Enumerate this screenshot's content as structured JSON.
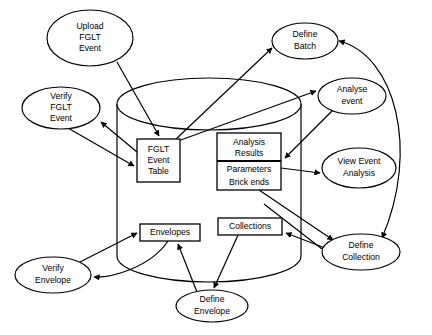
{
  "diagram": {
    "type": "data-flow-diagram",
    "background_color": "#ffffff",
    "line_color": "#000000",
    "datastore": {
      "name": "database-cylinder",
      "label": ""
    },
    "processes": [
      {
        "id": "upload-fglt-event",
        "lines": [
          "Upload",
          "FGLT",
          "Event"
        ],
        "cx": 90,
        "cy": 38,
        "rx": 43,
        "ry": 28
      },
      {
        "id": "verify-fglt-event",
        "lines": [
          "Verify",
          "FGLT",
          "Event"
        ],
        "cx": 61,
        "cy": 108,
        "rx": 39,
        "ry": 21
      },
      {
        "id": "define-batch",
        "lines": [
          "Define",
          "Batch"
        ],
        "cx": 305,
        "cy": 41,
        "rx": 33,
        "ry": 18
      },
      {
        "id": "analyse-event",
        "lines": [
          "Analyse",
          "event"
        ],
        "cx": 352,
        "cy": 96,
        "rx": 34,
        "ry": 18
      },
      {
        "id": "view-event-analysis",
        "lines": [
          "View Event",
          "Analysis"
        ],
        "cx": 359,
        "cy": 168,
        "rx": 37,
        "ry": 20
      },
      {
        "id": "define-collection",
        "lines": [
          "Define",
          "Collection"
        ],
        "cx": 361,
        "cy": 252,
        "rx": 39,
        "ry": 18
      },
      {
        "id": "verify-envelope",
        "lines": [
          "Verify",
          "Envelope"
        ],
        "cx": 53,
        "cy": 275,
        "rx": 38,
        "ry": 18
      },
      {
        "id": "define-envelope",
        "lines": [
          "Define",
          "Envelope"
        ],
        "cx": 212,
        "cy": 306,
        "rx": 36,
        "ry": 16
      }
    ],
    "tables": [
      {
        "id": "fglt-event-table",
        "lines": [
          "FGLT",
          "Event",
          "Table"
        ],
        "x": 137,
        "y": 139,
        "w": 43,
        "h": 43,
        "divider_y": null
      },
      {
        "id": "analysis-results-table",
        "lines": [
          "Analysis",
          "Results",
          "Parameters",
          "Brick ends"
        ],
        "x": 217,
        "y": 133,
        "w": 64,
        "h": 57,
        "divider_y": 161
      },
      {
        "id": "envelopes-table",
        "lines": [
          "Envelopes"
        ],
        "x": 140,
        "y": 224,
        "w": 60,
        "h": 17,
        "divider_y": null
      },
      {
        "id": "collections-table",
        "lines": [
          "Collections"
        ],
        "x": 218,
        "y": 218,
        "w": 64,
        "h": 17,
        "divider_y": null
      }
    ],
    "edges": [
      {
        "id": "edge-upload-to-fglt-table",
        "from": "upload-fglt-event",
        "to": "fglt-event-table"
      },
      {
        "id": "edge-fglt-table-to-verify-fglt",
        "from": "fglt-event-table",
        "to": "verify-fglt-event"
      },
      {
        "id": "edge-verify-fglt-to-fglt-table",
        "from": "verify-fglt-event",
        "to": "fglt-event-table"
      },
      {
        "id": "edge-fglt-table-to-define-batch",
        "from": "fglt-event-table",
        "to": "define-batch"
      },
      {
        "id": "edge-fglt-table-to-analyse-event",
        "from": "fglt-event-table",
        "to": "analyse-event"
      },
      {
        "id": "edge-analyse-event-to-analysis",
        "from": "analyse-event",
        "to": "analysis-results-table"
      },
      {
        "id": "edge-analysis-to-view-event",
        "from": "analysis-results-table",
        "to": "view-event-analysis"
      },
      {
        "id": "edge-analysis-to-define-collection",
        "from": "analysis-results-table",
        "to": "define-collection"
      },
      {
        "id": "edge-define-collection-to-collections",
        "from": "define-collection",
        "to": "collections-table"
      },
      {
        "id": "edge-collections-to-define-envelope",
        "from": "collections-table",
        "to": "define-envelope"
      },
      {
        "id": "edge-define-envelope-to-envelopes",
        "from": "define-envelope",
        "to": "envelopes-table"
      },
      {
        "id": "edge-envelopes-to-verify-envelope",
        "from": "envelopes-table",
        "to": "verify-envelope"
      },
      {
        "id": "edge-verify-envelope-to-envelopes",
        "from": "verify-envelope",
        "to": "envelopes-table"
      },
      {
        "id": "edge-define-collection-to-define-batch",
        "from": "define-collection",
        "to": "define-batch"
      },
      {
        "id": "edge-right-curve-to-define-collection",
        "from": "define-batch",
        "to": "define-collection"
      }
    ]
  }
}
